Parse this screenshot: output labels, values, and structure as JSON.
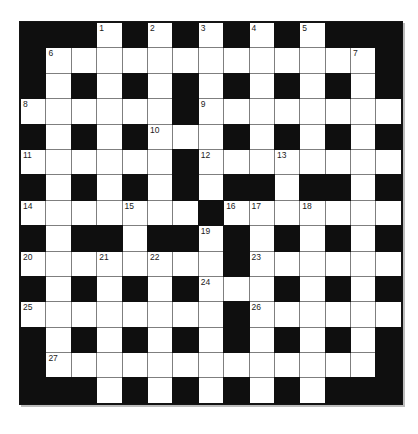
{
  "puzzle": {
    "type": "crossword",
    "rows": 15,
    "cols": 15,
    "grid": [
      "###.#.#.#.#.###",
      "#.............#",
      "#.#.#.#.#.#.#.#",
      "......#........",
      "#.#.#...#.#.#.#",
      "......#........",
      "#.#.#.#.##.##.#",
      ".......#.......",
      "#.##.##.#.#.#.#",
      "........#......",
      "#.#.#.#...#.#.#",
      "........#......",
      "#.#.#.#.#.#.#.#",
      "#.............#",
      "###.#.#.#.#.###"
    ],
    "numbers": [
      {
        "num": 1,
        "row": 1,
        "col": 4
      },
      {
        "num": 2,
        "row": 1,
        "col": 6
      },
      {
        "num": 3,
        "row": 1,
        "col": 8
      },
      {
        "num": 4,
        "row": 1,
        "col": 10
      },
      {
        "num": 5,
        "row": 1,
        "col": 12
      },
      {
        "num": 6,
        "row": 2,
        "col": 2
      },
      {
        "num": 7,
        "row": 2,
        "col": 14
      },
      {
        "num": 8,
        "row": 4,
        "col": 1
      },
      {
        "num": 9,
        "row": 4,
        "col": 8
      },
      {
        "num": 10,
        "row": 5,
        "col": 6
      },
      {
        "num": 11,
        "row": 6,
        "col": 1
      },
      {
        "num": 12,
        "row": 6,
        "col": 8
      },
      {
        "num": 13,
        "row": 6,
        "col": 11
      },
      {
        "num": 14,
        "row": 8,
        "col": 1
      },
      {
        "num": 15,
        "row": 8,
        "col": 5
      },
      {
        "num": 16,
        "row": 8,
        "col": 9
      },
      {
        "num": 17,
        "row": 8,
        "col": 10
      },
      {
        "num": 18,
        "row": 8,
        "col": 12
      },
      {
        "num": 19,
        "row": 9,
        "col": 8
      },
      {
        "num": 20,
        "row": 10,
        "col": 1
      },
      {
        "num": 21,
        "row": 10,
        "col": 4
      },
      {
        "num": 22,
        "row": 10,
        "col": 6
      },
      {
        "num": 23,
        "row": 10,
        "col": 10
      },
      {
        "num": 24,
        "row": 11,
        "col": 8
      },
      {
        "num": 25,
        "row": 12,
        "col": 1
      },
      {
        "num": 26,
        "row": 12,
        "col": 10
      },
      {
        "num": 27,
        "row": 14,
        "col": 2
      }
    ]
  },
  "colors": {
    "page_bg": "#ffffff",
    "black_cell": "#0f0f0f",
    "white_cell": "#ffffff",
    "grid_line": "#7f7f7f",
    "frame": "#151515",
    "number": "#1b1b1b"
  }
}
